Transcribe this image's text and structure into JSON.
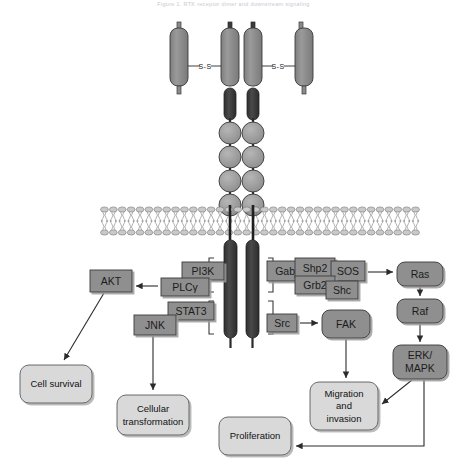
{
  "figure": {
    "faint_header": "Figure 1. RTK receptor dimer and downstream signaling",
    "faint_corner": "",
    "background": "#ffffff"
  },
  "colors": {
    "receptor_ectodomain": "#8a8a8a",
    "receptor_kinase_domain": "#3b3b3b",
    "ig_domain": "#9c9c9c",
    "protein_box": "#8f8f8f",
    "outcome_box": "#d9d9d9",
    "stroke": "#3a3a3a",
    "arrow": "#2b2b2b",
    "membrane_head": "#c9c9c9",
    "membrane_line": "#6f6f6f"
  },
  "receptor": {
    "name": "receptor-tyrosine-kinase-dimer",
    "disulfide_labels": [
      {
        "text": "S‑S",
        "x": 205,
        "y": 68
      },
      {
        "text": "S‑S",
        "x": 278,
        "y": 68
      }
    ],
    "ectodomain_rods": [
      {
        "name": "outer-left-rod",
        "x": 172,
        "y": 28,
        "w": 16,
        "h": 56
      },
      {
        "name": "inner-left-rod",
        "x": 222,
        "y": 28,
        "w": 16,
        "h": 56
      },
      {
        "name": "inner-right-rod",
        "x": 245,
        "y": 28,
        "w": 16,
        "h": 56
      },
      {
        "name": "outer-right-rod",
        "x": 294,
        "y": 28,
        "w": 16,
        "h": 56
      }
    ],
    "ig_domain_count_per_chain": 4,
    "ig_domain_radius": 11,
    "chains": [
      {
        "name": "left-chain",
        "x": 230
      },
      {
        "name": "right-chain",
        "x": 253
      }
    ]
  },
  "membrane": {
    "name": "plasma-membrane-lipid-bilayer",
    "x_start": 100,
    "x_end": 420,
    "y_top": 207,
    "y_bottom": 235,
    "lipid_count": 36
  },
  "proteins": [
    {
      "id": "pi3k",
      "label": "PI3K",
      "x": 182,
      "y": 262,
      "w": 42,
      "h": 18,
      "font": 10.5
    },
    {
      "id": "plcg",
      "label": "PLCγ",
      "x": 161,
      "y": 278,
      "w": 48,
      "h": 18,
      "font": 10.5
    },
    {
      "id": "akt",
      "label": "AKT",
      "x": 90,
      "y": 270,
      "w": 42,
      "h": 22,
      "font": 10.5
    },
    {
      "id": "stat3",
      "label": "STAT3",
      "x": 168,
      "y": 302,
      "w": 46,
      "h": 18,
      "font": 10.5
    },
    {
      "id": "jnk",
      "label": "JNK",
      "x": 134,
      "y": 315,
      "w": 42,
      "h": 20,
      "font": 10.5
    },
    {
      "id": "gab1",
      "label": "Gab1",
      "x": 267,
      "y": 261,
      "w": 42,
      "h": 20,
      "font": 10
    },
    {
      "id": "shp2",
      "label": "Shp2",
      "x": 295,
      "y": 258,
      "w": 40,
      "h": 20,
      "font": 10
    },
    {
      "id": "sos",
      "label": "SOS",
      "x": 331,
      "y": 261,
      "w": 34,
      "h": 20,
      "font": 10
    },
    {
      "id": "grb2",
      "label": "Grb2",
      "x": 295,
      "y": 276,
      "w": 40,
      "h": 18,
      "font": 10
    },
    {
      "id": "shc",
      "label": "Shc",
      "x": 326,
      "y": 281,
      "w": 32,
      "h": 18,
      "font": 10
    },
    {
      "id": "src",
      "label": "Src",
      "x": 267,
      "y": 314,
      "w": 30,
      "h": 18,
      "font": 10
    }
  ],
  "rounded_nodes": [
    {
      "id": "fak",
      "label": "FAK",
      "x": 322,
      "y": 310,
      "w": 48,
      "h": 28,
      "font": 10.5
    },
    {
      "id": "ras",
      "label": "Ras",
      "x": 397,
      "y": 262,
      "w": 46,
      "h": 24,
      "font": 10.5
    },
    {
      "id": "raf",
      "label": "Raf",
      "x": 397,
      "y": 299,
      "w": 46,
      "h": 24,
      "font": 10.5
    },
    {
      "id": "erk_mapk",
      "label_lines": [
        "ERK/",
        "MAPK"
      ],
      "x": 393,
      "y": 345,
      "w": 54,
      "h": 34,
      "font": 10.5
    }
  ],
  "outcomes": [
    {
      "id": "cell-survival",
      "label_lines": [
        "Cell survival"
      ],
      "x": 20,
      "y": 365,
      "w": 72,
      "h": 38,
      "font": 9.5
    },
    {
      "id": "cellular-transformation",
      "label_lines": [
        "Cellular",
        "transformation"
      ],
      "x": 117,
      "y": 395,
      "w": 72,
      "h": 40,
      "font": 9.5
    },
    {
      "id": "proliferation",
      "label_lines": [
        "Proliferation"
      ],
      "x": 219,
      "y": 417,
      "w": 72,
      "h": 38,
      "font": 9.5
    },
    {
      "id": "migration-invasion",
      "label_lines": [
        "Migration",
        "and",
        "invasion"
      ],
      "x": 310,
      "y": 382,
      "w": 68,
      "h": 48,
      "font": 9.5
    }
  ],
  "arrows": [
    {
      "id": "plcg-to-akt",
      "from": "PLCγ",
      "to": "AKT"
    },
    {
      "id": "akt-to-cell-survival",
      "from": "AKT",
      "to": "Cell survival"
    },
    {
      "id": "jnk-to-transformation",
      "from": "JNK",
      "to": "Cellular transformation"
    },
    {
      "id": "adaptors-to-ras",
      "from": "Grb2/SOS",
      "to": "Ras"
    },
    {
      "id": "ras-to-raf",
      "from": "Ras",
      "to": "Raf"
    },
    {
      "id": "raf-to-erk",
      "from": "Raf",
      "to": "ERK/MAPK"
    },
    {
      "id": "erk-to-migration",
      "from": "ERK/MAPK",
      "to": "Migration and invasion"
    },
    {
      "id": "erk-to-proliferation",
      "from": "ERK/MAPK",
      "to": "Proliferation"
    },
    {
      "id": "src-to-fak",
      "from": "Src",
      "to": "FAK"
    },
    {
      "id": "fak-to-migration",
      "from": "FAK",
      "to": "Migration and invasion"
    }
  ],
  "brackets": [
    {
      "id": "bracket-left-upper",
      "side": "left",
      "x": 208,
      "y": 258,
      "h": 34
    },
    {
      "id": "bracket-left-lower",
      "side": "left",
      "x": 208,
      "y": 300,
      "h": 34
    },
    {
      "id": "bracket-right-upper",
      "side": "right",
      "x": 272,
      "y": 258,
      "h": 34
    },
    {
      "id": "bracket-right-lower",
      "side": "right",
      "x": 272,
      "y": 300,
      "h": 34
    }
  ]
}
